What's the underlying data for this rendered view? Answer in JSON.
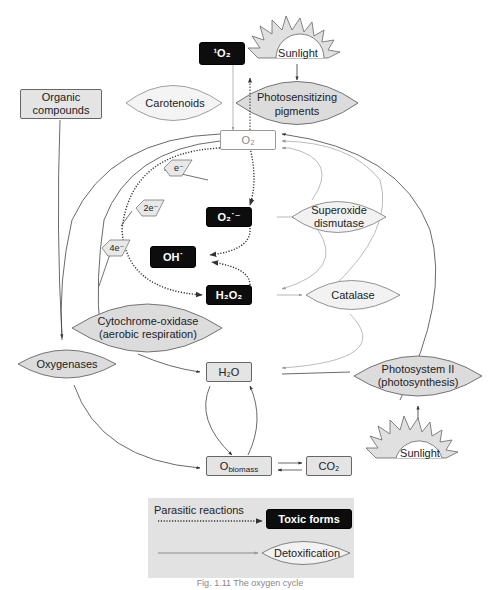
{
  "diagram": {
    "nodes": {
      "singlet_oxygen": "¹O₂",
      "sunlight_top": "Sunlight",
      "carotenoids": "Carotenoids",
      "photosensitizing_pigments_1": "Photosensitizing",
      "photosensitizing_pigments_2": "pigments",
      "organic_compounds_1": "Organic",
      "organic_compounds_2": "compounds",
      "o2": "O₂",
      "electron_1": "e⁻",
      "electron_2": "2e⁻",
      "electron_4": "4e⁻",
      "superoxide": "O₂˙⁻",
      "superoxide_dismutase_1": "Superoxide",
      "superoxide_dismutase_2": "dismutase",
      "hydroxyl": "OH˙",
      "hydrogen_peroxide": "H₂O₂",
      "catalase": "Catalase",
      "cytochrome_oxidase_1": "Cytochrome-oxidase",
      "cytochrome_oxidase_2": "(aerobic respiration)",
      "oxygenases": "Oxygenases",
      "water": "H₂O",
      "photosystem_1": "Photosystem II",
      "photosystem_2": "(photosynthesis)",
      "o_biomass": "O",
      "o_biomass_sub": "biomass",
      "co2": "CO₂",
      "sunlight_bottom": "Sunlight"
    },
    "legend": {
      "parasitic_label": "Parasitic reactions",
      "toxic_label": "Toxic forms",
      "detox_label": "Detoxification"
    },
    "caption": "Fig. 1.11 The oxygen cycle"
  },
  "colors": {
    "toxic_fill": "#0d0d0d",
    "enzyme_fill": "#dcdcdc",
    "box_fill": "#e4e4e4",
    "legend_bg": "#e2e2e2",
    "detox_line": "#aaaaaa"
  }
}
